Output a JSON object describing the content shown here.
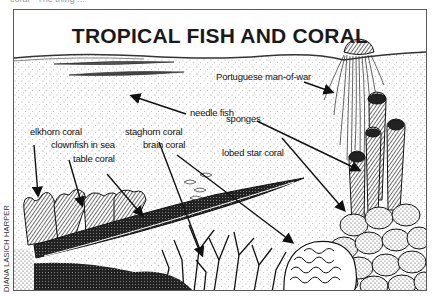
{
  "figure": {
    "title": "TROPICAL FISH AND CORAL",
    "top_cut_text": "coral · The thing ...",
    "credit": "DIANA LASICH HARPER",
    "style": "black-and-white stippled pen illustration",
    "colors": {
      "ink": "#111111",
      "paper": "#ffffff",
      "frame": "#5a5a5a"
    }
  },
  "labels": [
    {
      "id": "portuguese-man-of-war",
      "text": "Portuguese man-of-war"
    },
    {
      "id": "needle-fish",
      "text": "needle fish"
    },
    {
      "id": "sponges",
      "text": "sponges"
    },
    {
      "id": "elkhorn-coral",
      "text": "elkhorn coral"
    },
    {
      "id": "staghorn-coral",
      "text": "staghorn coral"
    },
    {
      "id": "clownfish-in-sea",
      "text": "clownfish in sea"
    },
    {
      "id": "brain-coral",
      "text": "brain coral"
    },
    {
      "id": "table-coral",
      "text": "table coral"
    },
    {
      "id": "lobed-star-coral",
      "text": "lobed star coral"
    }
  ]
}
